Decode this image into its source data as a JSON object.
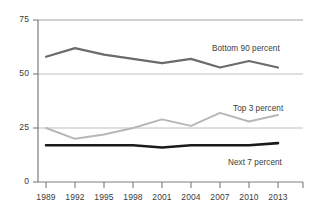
{
  "chart_data": {
    "type": "line",
    "title": "",
    "xlabel": "",
    "ylabel": "",
    "categories": [
      "1989",
      "1992",
      "1995",
      "1998",
      "2001",
      "2004",
      "2007",
      "2010",
      "2013"
    ],
    "ylim": [
      0,
      75
    ],
    "yticks": [
      "0",
      "25",
      "50",
      "75"
    ],
    "ytick_values": [
      0,
      25,
      50,
      75
    ],
    "grid": true,
    "legend_position": "inline-right",
    "series": [
      {
        "name": "Bottom 90 percent",
        "color": "#6b6b6b",
        "values": [
          58,
          62,
          59,
          57,
          55,
          57,
          53,
          56,
          53
        ]
      },
      {
        "name": "Top 3 percent",
        "color": "#b7b7b7",
        "values": [
          25,
          20,
          22,
          25,
          29,
          26,
          32,
          28,
          31
        ]
      },
      {
        "name": "Next 7 percent",
        "color": "#1a1a1a",
        "values": [
          17,
          17,
          17,
          17,
          16,
          17,
          17,
          17,
          18
        ]
      }
    ]
  },
  "axis": {
    "y_ticks": [
      {
        "label": "75",
        "value": 75
      },
      {
        "label": "50",
        "value": 50
      },
      {
        "label": "25",
        "value": 25
      },
      {
        "label": "0",
        "value": 0
      }
    ],
    "x_ticks": [
      {
        "label": "1989"
      },
      {
        "label": "1992"
      },
      {
        "label": "1995"
      },
      {
        "label": "1998"
      },
      {
        "label": "2001"
      },
      {
        "label": "2004"
      },
      {
        "label": "2007"
      },
      {
        "label": "2010"
      },
      {
        "label": "2013"
      }
    ]
  },
  "annotations": {
    "bottom90": "Bottom 90 percent",
    "top3": "Top 3 percent",
    "next7": "Next 7 percent"
  }
}
